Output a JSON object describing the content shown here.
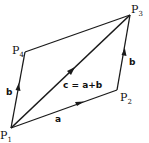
{
  "diagram": {
    "points": [
      {
        "id": "P1",
        "label": "P",
        "sub": "1",
        "x": 11,
        "y": 128
      },
      {
        "id": "P2",
        "label": "P",
        "sub": "2",
        "x": 117,
        "y": 90
      },
      {
        "id": "P3",
        "label": "P",
        "sub": "3",
        "x": 130,
        "y": 15
      },
      {
        "id": "P4",
        "label": "P",
        "sub": "4",
        "x": 25,
        "y": 52
      }
    ],
    "edges": [
      {
        "from": "P1",
        "to": "P2",
        "label": "a",
        "arrow": true
      },
      {
        "from": "P2",
        "to": "P3",
        "label": "b",
        "arrow": true
      },
      {
        "from": "P1",
        "to": "P4",
        "label": "b",
        "arrow": true
      },
      {
        "from": "P4",
        "to": "P3",
        "label": "",
        "arrow": false
      },
      {
        "from": "P1",
        "to": "P3",
        "label": "c = a+b",
        "arrow": true
      }
    ],
    "labels": {
      "a": "a",
      "b_right": "b",
      "b_left": "b",
      "c": "c = a+b"
    },
    "colors": {
      "stroke": "#1a1a1a",
      "background": "#ffffff"
    }
  }
}
